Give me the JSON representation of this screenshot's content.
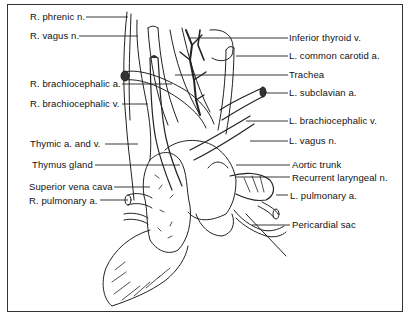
{
  "figure": {
    "type": "anatomical illustration",
    "border_color": "#333333",
    "text_color": "#111111"
  },
  "labels_left": [
    {
      "text": "R. phrenic n.",
      "x": 30,
      "y": 12,
      "line_to": [
        128,
        16
      ]
    },
    {
      "text": "R. vagus n.",
      "x": 30,
      "y": 31,
      "line_to": [
        138,
        35
      ]
    },
    {
      "text": "R. brachiocephalic a.",
      "x": 30,
      "y": 79,
      "line_to": [
        172,
        84
      ]
    },
    {
      "text": "R. brachiocephalic v.",
      "x": 30,
      "y": 99,
      "line_to": [
        148,
        104
      ]
    },
    {
      "text": "Thymic a. and v.",
      "x": 30,
      "y": 139,
      "line_to": [
        138,
        144
      ]
    },
    {
      "text": "Thymus gland",
      "x": 32,
      "y": 160,
      "line_to": [
        180,
        165
      ]
    },
    {
      "text": "Superior vena cava",
      "x": 29,
      "y": 182,
      "line_to": [
        150,
        187
      ]
    },
    {
      "text": "R. pulmonary a.",
      "x": 29,
      "y": 196,
      "line_to": [
        138,
        200
      ]
    }
  ],
  "labels_right": [
    {
      "text": "Inferior thyroid v.",
      "x": 289,
      "y": 33,
      "line_from": [
        190,
        38
      ]
    },
    {
      "text": "L. common carotid a.",
      "x": 289,
      "y": 51,
      "line_from": [
        236,
        56
      ]
    },
    {
      "text": "Trachea",
      "x": 289,
      "y": 70,
      "line_from": [
        175,
        75
      ]
    },
    {
      "text": "L. subclavian a.",
      "x": 289,
      "y": 88,
      "line_from": [
        262,
        93
      ]
    },
    {
      "text": "L. brachiocephalic v.",
      "x": 289,
      "y": 116,
      "line_from": [
        246,
        121
      ]
    },
    {
      "text": "L. vagus n.",
      "x": 289,
      "y": 136,
      "line_from": [
        250,
        141
      ]
    },
    {
      "text": "Aortic trunk",
      "x": 292,
      "y": 160,
      "line_from": [
        236,
        165
      ]
    },
    {
      "text": "Recurrent laryngeal n.",
      "x": 292,
      "y": 173,
      "line_from": [
        236,
        177
      ]
    },
    {
      "text": "L. pulmonary a.",
      "x": 290,
      "y": 191,
      "line_from": [
        276,
        195
      ]
    },
    {
      "text": "Pericardial sac",
      "x": 292,
      "y": 218,
      "line_from": [
        252,
        225
      ]
    }
  ]
}
